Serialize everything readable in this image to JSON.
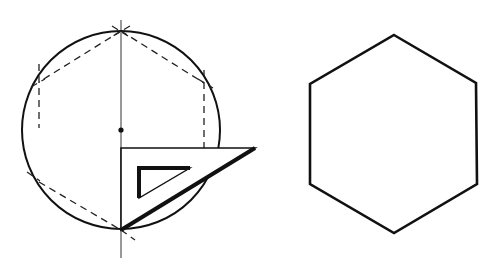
{
  "figure": {
    "stroke_color": "#111111",
    "background": "#ffffff",
    "construction": {
      "circle": {
        "cx": 121,
        "cy": 130,
        "r": 99
      },
      "center_point": {
        "x": 121,
        "y": 130
      },
      "vertical_axis": {
        "x": 121,
        "y1": 20,
        "y2": 258
      },
      "hexagon_vertices": [
        [
          121,
          31
        ],
        [
          204,
          83
        ],
        [
          204,
          181
        ],
        [
          121,
          230
        ],
        [
          39,
          182
        ],
        [
          39,
          82
        ]
      ],
      "dashed_edges": [
        [
          [
            121,
            31
          ],
          [
            204,
            83
          ]
        ],
        [
          [
            121,
            31
          ],
          [
            39,
            82
          ]
        ],
        [
          [
            39,
            182
          ],
          [
            121,
            230
          ]
        ]
      ],
      "dashed_extensions": [
        [
          [
            112,
            26
          ],
          [
            128,
            36
          ]
        ],
        [
          [
            130,
            26
          ],
          [
            113,
            36
          ]
        ],
        [
          [
            198,
            79
          ],
          [
            213,
            88
          ]
        ],
        [
          [
            31,
            87
          ],
          [
            45,
            79
          ]
        ],
        [
          [
            27,
            172
          ],
          [
            40,
            181
          ]
        ],
        [
          [
            121,
            230
          ],
          [
            135,
            240
          ]
        ]
      ],
      "dashed_verticals": [
        {
          "x": 39,
          "y1": 64,
          "y2": 128
        },
        {
          "x": 204,
          "y1": 70,
          "y2": 148
        }
      ],
      "set_square": {
        "outer": [
          [
            121,
            148
          ],
          [
            255,
            148
          ],
          [
            121,
            230
          ]
        ],
        "inner": [
          [
            139,
            168
          ],
          [
            190,
            168
          ],
          [
            139,
            198
          ]
        ]
      }
    },
    "result_hexagon": {
      "vertices": [
        [
          394,
          35
        ],
        [
          476,
          83
        ],
        [
          477,
          184
        ],
        [
          394,
          233
        ],
        [
          310,
          184
        ],
        [
          310,
          84
        ]
      ]
    }
  }
}
